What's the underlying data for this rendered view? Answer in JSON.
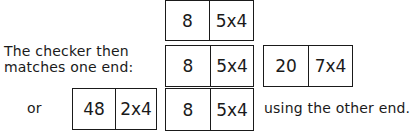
{
  "caption": {
    "line1": "The checker then",
    "line2": "matches one end:",
    "or": "or",
    "using": "using the other end."
  },
  "dominoes": {
    "top": {
      "left": "8",
      "right": "5x4"
    },
    "middle": {
      "left": "8",
      "right": "5x4"
    },
    "match_right": {
      "left": "20",
      "right": "7x4"
    },
    "match_left": {
      "left": "48",
      "right": "2x4"
    },
    "bottom": {
      "left": "8",
      "right": "5x4"
    }
  }
}
